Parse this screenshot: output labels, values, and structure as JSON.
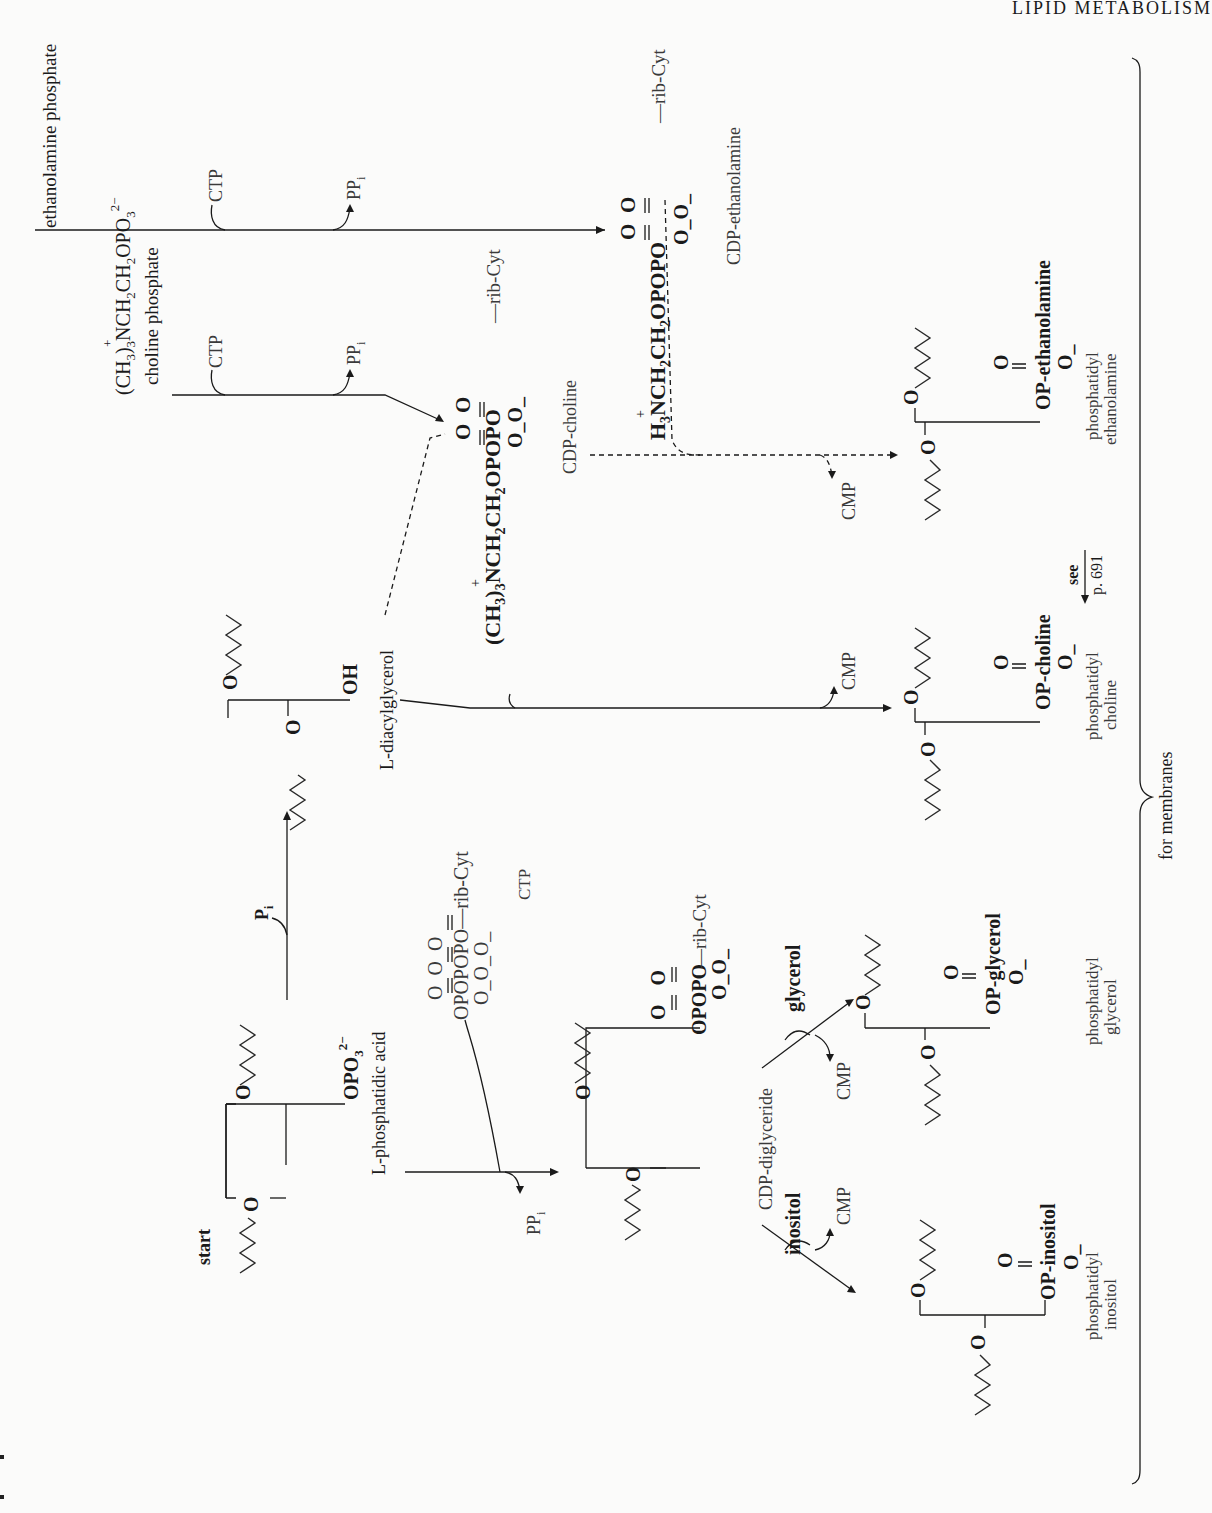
{
  "page": {
    "running_head": "LIPID METABOLISM",
    "orientation": "rotated-90-ccw"
  },
  "diagram": {
    "start_label": "start",
    "phosphatidic_acid": {
      "group": "OPO",
      "group_sub": "3",
      "group_sup": "2−",
      "name": "L-phosphatidic acid"
    },
    "ctp_donor": {
      "top": "O   O   O",
      "formula": "OPOPOPO—rib-Cyt",
      "charges": "O_O_O_",
      "name": "CTP"
    },
    "ppi_release_1": {
      "label": "PP",
      "sub": "i"
    },
    "cdp_diglyceride": {
      "top": "O   O",
      "formula": "OPOPO—rib-Cyt",
      "charges": "O_O_",
      "name": "CDP-diglyceride"
    },
    "pi_release": {
      "label": "P",
      "sub": "i"
    },
    "diacylglycerol": {
      "group": "OH",
      "name": "L-diacylglycerol"
    },
    "choline_phosphate": {
      "formula": "(CH3)3NCH2CH2OPO3 2−",
      "name": "choline phosphate"
    },
    "ethanolamine_phosphate": {
      "name": "ethanolamine phosphate"
    },
    "ctp_in_1": "CTP",
    "ppi_out_2": {
      "label": "PP",
      "sub": "i"
    },
    "ctp_in_2": "CTP",
    "ppi_out_3": {
      "label": "PP",
      "sub": "i"
    },
    "cdp_choline": {
      "top": "O   O",
      "formula": "(CH3)3NCH2CH2OPOPO—rib-Cyt",
      "charges": "O_O_",
      "name": "CDP-choline"
    },
    "cdp_ethanolamine": {
      "top": "O   O",
      "formula": "H3NCH2CH2OPOPO—rib-Cyt",
      "charges": "O_O_",
      "name": "CDP-ethanolamine"
    },
    "cmp_1": "CMP",
    "cmp_2": "CMP",
    "cmp_3": "CMP",
    "cmp_4": "CMP",
    "inositol_in": "inositol",
    "glycerol_in": "glycerol",
    "products": [
      {
        "head": "OP-inositol",
        "o_top": "O",
        "o_bottom": "O_",
        "name_line1": "phosphatidyl",
        "name_line2": "inositol"
      },
      {
        "head": "OP-glycerol",
        "o_top": "O",
        "o_bottom": "O_",
        "name_line1": "phosphatidyl",
        "name_line2": "glycerol"
      },
      {
        "head": "OP-choline",
        "o_top": "O",
        "o_bottom": "O_",
        "name_line1": "phosphatidyl",
        "name_line2": "choline"
      },
      {
        "head": "OP-ethanolamine",
        "o_top": "O",
        "o_bottom": "O_",
        "name_line1": "phosphatidyl",
        "name_line2": "ethanolamine"
      }
    ],
    "see_ref": {
      "line1": "see",
      "line2": "p. 691"
    },
    "bracket_label": "for membranes",
    "ether_O": "O"
  }
}
